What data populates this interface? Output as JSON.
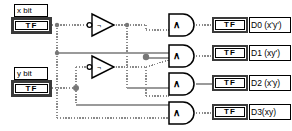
{
  "diagram": {
    "background": "#ffffff",
    "wire_color": "#808080",
    "outline_color": "#000000"
  },
  "controls": [
    {
      "id": "x-bit",
      "label": "x bit",
      "terminal_text": "TF",
      "type": "boolean-control"
    },
    {
      "id": "y-bit",
      "label": "y bit",
      "terminal_text": "TF",
      "type": "boolean-control"
    }
  ],
  "not_gates": [
    {
      "id": "not-x",
      "symbol": "¬",
      "name": "not-gate-x"
    },
    {
      "id": "not-y",
      "symbol": "¬",
      "name": "not-gate-y"
    }
  ],
  "and_gates": [
    {
      "id": "and-0",
      "symbol": "∧"
    },
    {
      "id": "and-1",
      "symbol": "∧"
    },
    {
      "id": "and-2",
      "symbol": "∧"
    },
    {
      "id": "and-3",
      "symbol": "∧"
    }
  ],
  "indicators": [
    {
      "id": "d0",
      "terminal_text": "TF",
      "label": "D0 (x'y')"
    },
    {
      "id": "d1",
      "terminal_text": "TF",
      "label": "D1 (xy')"
    },
    {
      "id": "d2",
      "terminal_text": "TF",
      "label": "D2 (x'y)"
    },
    {
      "id": "d3",
      "terminal_text": "TF",
      "label": "D3(xy)"
    }
  ]
}
